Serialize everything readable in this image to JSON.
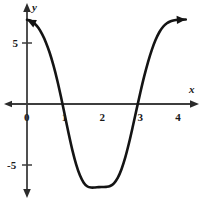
{
  "chart_data": {
    "type": "line",
    "title": "",
    "subtitle": "",
    "xlabel": "x",
    "ylabel": "y",
    "xlim": [
      -0.45,
      4.6
    ],
    "ylim": [
      -8.0,
      8.2
    ],
    "grid": false,
    "legend": null,
    "xticks": [
      0,
      1,
      2,
      3,
      4
    ],
    "xtick_labels": [
      "0",
      "1",
      "2",
      "3",
      "4"
    ],
    "yticks": [
      5,
      -5
    ],
    "ytick_labels": [
      "5",
      "-5"
    ],
    "axis_arrows": {
      "x_right": true,
      "y_top": true,
      "y_bottom": true
    },
    "series": [
      {
        "name": "curve",
        "color": "#141414",
        "linewidth": 2.6,
        "arrow_start": true,
        "arrow_end": true,
        "roots": [
          1,
          3
        ],
        "local_max": {
          "x": 0.0,
          "y": 6.9
        },
        "local_min": {
          "x": 2.0,
          "y": -6.8
        },
        "x": [
          0.0,
          0.1,
          0.2,
          0.3,
          0.4,
          0.5,
          0.6,
          0.7,
          0.8,
          0.9,
          1.0,
          1.1,
          1.2,
          1.3,
          1.4,
          1.5,
          1.6,
          1.7,
          1.8,
          1.9,
          2.0,
          2.1,
          2.2,
          2.3,
          2.4,
          2.5,
          2.6,
          2.7,
          2.8,
          2.9,
          3.0,
          3.1,
          3.2,
          3.3,
          3.4,
          3.5,
          3.6,
          3.7,
          3.8,
          3.9,
          4.0,
          4.1,
          4.2
        ],
        "y": [
          6.9,
          6.83,
          6.6,
          6.24,
          5.72,
          5.05,
          4.2,
          3.16,
          1.95,
          0.57,
          -0.91,
          -2.4,
          -3.78,
          -4.95,
          -5.85,
          -6.45,
          -6.76,
          -6.85,
          -6.84,
          -6.81,
          -6.8,
          -6.79,
          -6.72,
          -6.5,
          -6.06,
          -5.35,
          -4.38,
          -3.18,
          -1.83,
          -0.42,
          0.96,
          2.26,
          3.42,
          4.42,
          5.24,
          5.88,
          6.33,
          6.62,
          6.78,
          6.86,
          6.9,
          6.92,
          6.93
        ]
      }
    ]
  },
  "axis_labels": {
    "x": "x",
    "y": "y"
  }
}
